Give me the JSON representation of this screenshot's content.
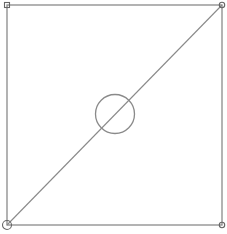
{
  "diagram": {
    "type": "geometric-construction",
    "elements": [
      {
        "kind": "square",
        "label": "outer-square"
      },
      {
        "kind": "segment",
        "label": "diagonal",
        "from": "bottom-left",
        "to": "top-right"
      },
      {
        "kind": "circle",
        "label": "center-circle"
      },
      {
        "kind": "handle",
        "shape": "square",
        "corner": "top-left"
      },
      {
        "kind": "handle",
        "shape": "circle",
        "corner": "top-right"
      },
      {
        "kind": "handle",
        "shape": "circle",
        "corner": "bottom-right"
      },
      {
        "kind": "handle",
        "shape": "circle-large",
        "corner": "bottom-left"
      }
    ],
    "colors": {
      "stroke": "#8a8a8a",
      "handle": "#666666",
      "background": "#ffffff"
    }
  }
}
